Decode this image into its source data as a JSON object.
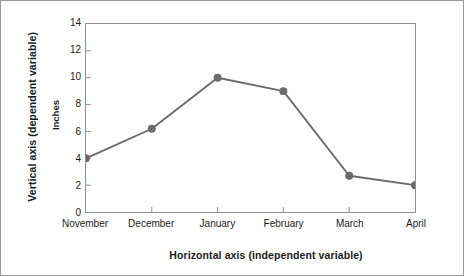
{
  "chart_data": {
    "type": "line",
    "title": "",
    "subtitle": "",
    "xlabel": "Horizontal axis (independent variable)",
    "ylabel": "Inches",
    "y_axis_title": "Vertical axis (dependent variable)",
    "categories": [
      "November",
      "December",
      "January",
      "February",
      "March",
      "April"
    ],
    "values": [
      4,
      6.2,
      10,
      9,
      2.7,
      2
    ],
    "series": [
      {
        "name": "Inches",
        "values": [
          4,
          6.2,
          10,
          9,
          2.7,
          2
        ]
      }
    ],
    "ylim": [
      0,
      14
    ],
    "ytick_labels": [
      "0",
      "2",
      "4",
      "6",
      "8",
      "10",
      "12",
      "14"
    ],
    "ytick_values": [
      0,
      2,
      4,
      6,
      8,
      10,
      12,
      14
    ],
    "grid": false,
    "legend": "none",
    "marker": "circle",
    "colors": {
      "line": "#6b6b6b",
      "marker": "#6b6b6b",
      "axis": "#8f8f8f",
      "text": "#1b1b1b",
      "background": "#ffffff",
      "figure_border": "#9a9a9a"
    }
  }
}
